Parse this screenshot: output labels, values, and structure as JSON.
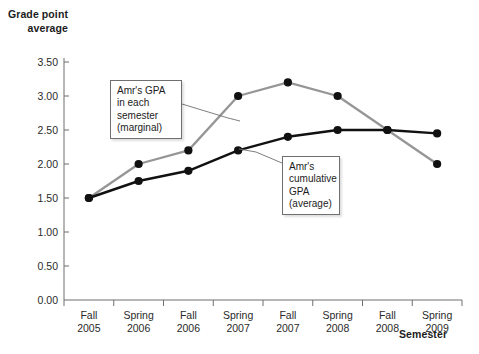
{
  "chart_data": {
    "type": "line",
    "title": "",
    "subtitle": "",
    "xlabel": "Semester",
    "ylabel": "Grade point average",
    "categories": [
      "Fall 2005",
      "Spring 2006",
      "Fall 2006",
      "Spring 2007",
      "Fall 2007",
      "Spring 2008",
      "Fall 2008",
      "Spring 2009"
    ],
    "x_tick_labels": [
      {
        "line1": "Fall",
        "line2": "2005"
      },
      {
        "line1": "Spring",
        "line2": "2006"
      },
      {
        "line1": "Fall",
        "line2": "2006"
      },
      {
        "line1": "Spring",
        "line2": "2007"
      },
      {
        "line1": "Fall",
        "line2": "2007"
      },
      {
        "line1": "Spring",
        "line2": "2008"
      },
      {
        "line1": "Fall",
        "line2": "2008"
      },
      {
        "line1": "Spring",
        "line2": "2009"
      }
    ],
    "y_tick_labels": [
      "0.00",
      "0.50",
      "1.00",
      "1.50",
      "2.00",
      "2.50",
      "3.00",
      "3.50"
    ],
    "y_tick_values": [
      0.0,
      0.5,
      1.0,
      1.5,
      2.0,
      2.5,
      3.0,
      3.5
    ],
    "ylim": [
      0.0,
      3.5
    ],
    "grid": false,
    "legend": "none",
    "series": [
      {
        "name": "Amr's GPA in each semester (marginal)",
        "color": "#969696",
        "marker_color": "#111111",
        "values": [
          1.5,
          2.0,
          2.2,
          3.0,
          3.2,
          3.0,
          2.5,
          2.0
        ]
      },
      {
        "name": "Amr's cumulative GPA (average)",
        "color": "#111111",
        "marker_color": "#111111",
        "values": [
          1.5,
          1.75,
          1.9,
          2.2,
          2.4,
          2.5,
          2.5,
          2.45
        ]
      }
    ],
    "annotations": [
      {
        "id": "marginal",
        "lines": [
          "Amr's GPA",
          "in each",
          "semester",
          "(marginal)"
        ],
        "target_series": "Amr's GPA in each semester (marginal)"
      },
      {
        "id": "cumulative",
        "lines": [
          "Amr's",
          "cumulative",
          "GPA",
          "(average)"
        ],
        "target_series": "Amr's cumulative GPA (average)"
      }
    ]
  },
  "colors": {
    "axis": "#6f6f6f",
    "marginal_line": "#969696",
    "cumulative_line": "#111111",
    "marker": "#111111",
    "text": "#1c1c1c",
    "callout_border": "#6f6f6f",
    "background": "#ffffff"
  }
}
